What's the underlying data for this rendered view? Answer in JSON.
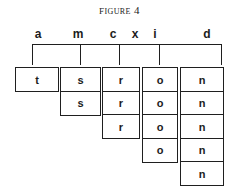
{
  "figure": {
    "title": "Figure 4",
    "accent_color": "#1f1f1f",
    "background_color": "#ffffff"
  },
  "labels": [
    {
      "text": "a",
      "x": 38,
      "has_tick": true,
      "tick_x": 32
    },
    {
      "text": "m",
      "x": 78,
      "has_tick": true,
      "tick_x": 80
    },
    {
      "text": "c",
      "x": 113,
      "has_tick": true,
      "tick_x": 119
    },
    {
      "text": "x",
      "x": 135,
      "has_tick": false,
      "tick_x": null
    },
    {
      "text": "i",
      "x": 155,
      "has_tick": true,
      "tick_x": 159
    },
    {
      "text": "d",
      "x": 207,
      "has_tick": true,
      "tick_x": 221
    }
  ],
  "columns": [
    {
      "label": "a",
      "left": 15,
      "width": 44,
      "cell_height": 25,
      "cells": [
        "t"
      ]
    },
    {
      "label": "m",
      "left": 60,
      "width": 41,
      "cell_height": 25,
      "cells": [
        "s",
        "s"
      ]
    },
    {
      "label": "c",
      "left": 102,
      "width": 38,
      "cell_height": 25,
      "cells": [
        "r",
        "r",
        "r"
      ]
    },
    {
      "label": "i",
      "left": 142,
      "width": 36,
      "cell_height": 25,
      "cells": [
        "o",
        "o",
        "o",
        "o"
      ]
    },
    {
      "label": "d",
      "left": 180,
      "width": 44,
      "cell_height": 25,
      "cells": [
        "n",
        "n",
        "n",
        "n",
        "n"
      ]
    }
  ]
}
